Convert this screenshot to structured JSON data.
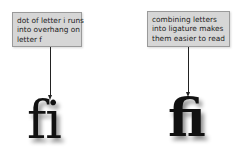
{
  "left_example": {
    "caption_lines": [
      "dot of letter i runs",
      "into overhang on",
      "letter f"
    ],
    "glyph": "fi"
  },
  "right_example": {
    "caption_lines": [
      "combining letters",
      "into ligature makes",
      "them easier to read"
    ],
    "glyph": "ﬁ"
  },
  "colors": {
    "callout_bg": "#d6d6d6",
    "callout_border": "#9a9a9a",
    "glyph": "#111111"
  }
}
